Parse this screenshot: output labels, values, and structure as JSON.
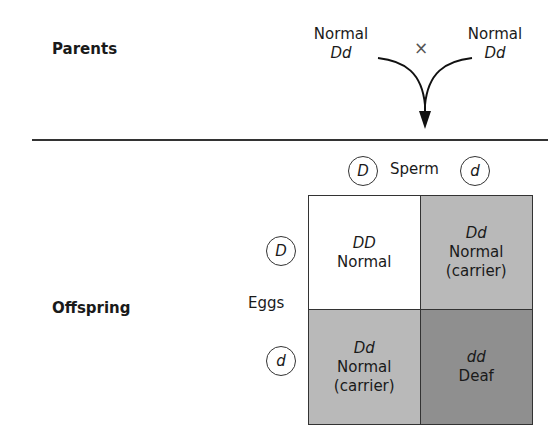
{
  "sections": {
    "parents_label": "Parents",
    "offspring_label": "Offspring"
  },
  "parents": {
    "left": {
      "phenotype": "Normal",
      "genotype": "Dd"
    },
    "right": {
      "phenotype": "Normal",
      "genotype": "Dd"
    },
    "cross_symbol": "×"
  },
  "punnett": {
    "sperm_label": "Sperm",
    "eggs_label": "Eggs",
    "sperm_alleles": [
      "D",
      "d"
    ],
    "egg_alleles": [
      "D",
      "d"
    ],
    "cells": [
      {
        "genotype": "DD",
        "phenotype": "Normal",
        "note": "",
        "color": "#ffffff"
      },
      {
        "genotype": "Dd",
        "phenotype": "Normal",
        "note": "(carrier)",
        "color": "#b9b9b9"
      },
      {
        "genotype": "Dd",
        "phenotype": "Normal",
        "note": "(carrier)",
        "color": "#b9b9b9"
      },
      {
        "genotype": "dd",
        "phenotype": "Deaf",
        "note": "",
        "color": "#8f8f8f"
      }
    ]
  }
}
